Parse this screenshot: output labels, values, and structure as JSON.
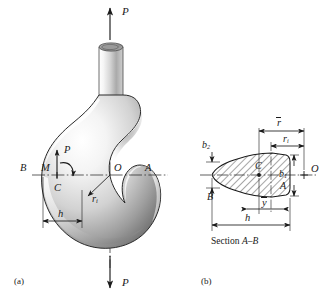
{
  "figure": {
    "type": "engineering-mechanics-diagram",
    "background_color": "#ffffff",
    "line_color": "#1a1a1a",
    "hook_fill_light": "#f2f2f2",
    "hook_fill_mid": "#b8b8b8",
    "hook_fill_dark": "#6e6e6e",
    "hatch_color": "#3a3a3a"
  },
  "panel_a": {
    "panel_label": "(a)",
    "description": "Side view of a crane hook loaded by force P along its shank axis",
    "labels": {
      "load_top": "P",
      "load_bottom": "P",
      "load_internal": "P",
      "moment": "M",
      "centroid": "C",
      "center_of_curvature": "O",
      "point_b": "B",
      "point_a": "A",
      "inner_radius": "r",
      "inner_radius_sub": "i",
      "depth": "h"
    }
  },
  "panel_b": {
    "panel_label": "(b)",
    "caption_prefix": "Section ",
    "caption_section": "A–B",
    "description": "Trapezoidal hatched cross section A-B of the hook",
    "labels": {
      "width_top": "b",
      "width_top_sub": "2",
      "width_bottom": "b",
      "width_bottom_sub": "1",
      "point_b": "B",
      "point_a": "A",
      "centroid": "C",
      "center_of_curvature": "O",
      "mean_radius": "r",
      "inner_radius": "r",
      "inner_radius_sub": "i",
      "centroid_distance": "y",
      "depth": "h"
    }
  }
}
